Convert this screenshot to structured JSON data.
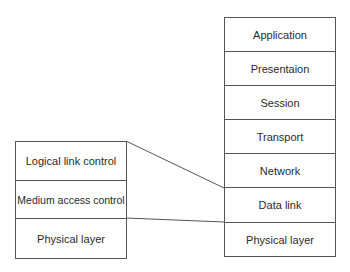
{
  "diagram": {
    "osi_layers": [
      "Application",
      "Presentaion",
      "Session",
      "Transport",
      "Network",
      "Data link",
      "Physical layer"
    ],
    "ieee_layers": [
      "Logical link control",
      "Medium access control",
      "Physical layer"
    ],
    "mapping": [
      {
        "from": "Logical link control + Medium access control",
        "to": "Data link"
      },
      {
        "from": "Physical layer",
        "to": "Physical layer"
      }
    ],
    "colors": {
      "line": "#555555",
      "text": "#2a2a2a",
      "background": "#ffffff"
    }
  }
}
